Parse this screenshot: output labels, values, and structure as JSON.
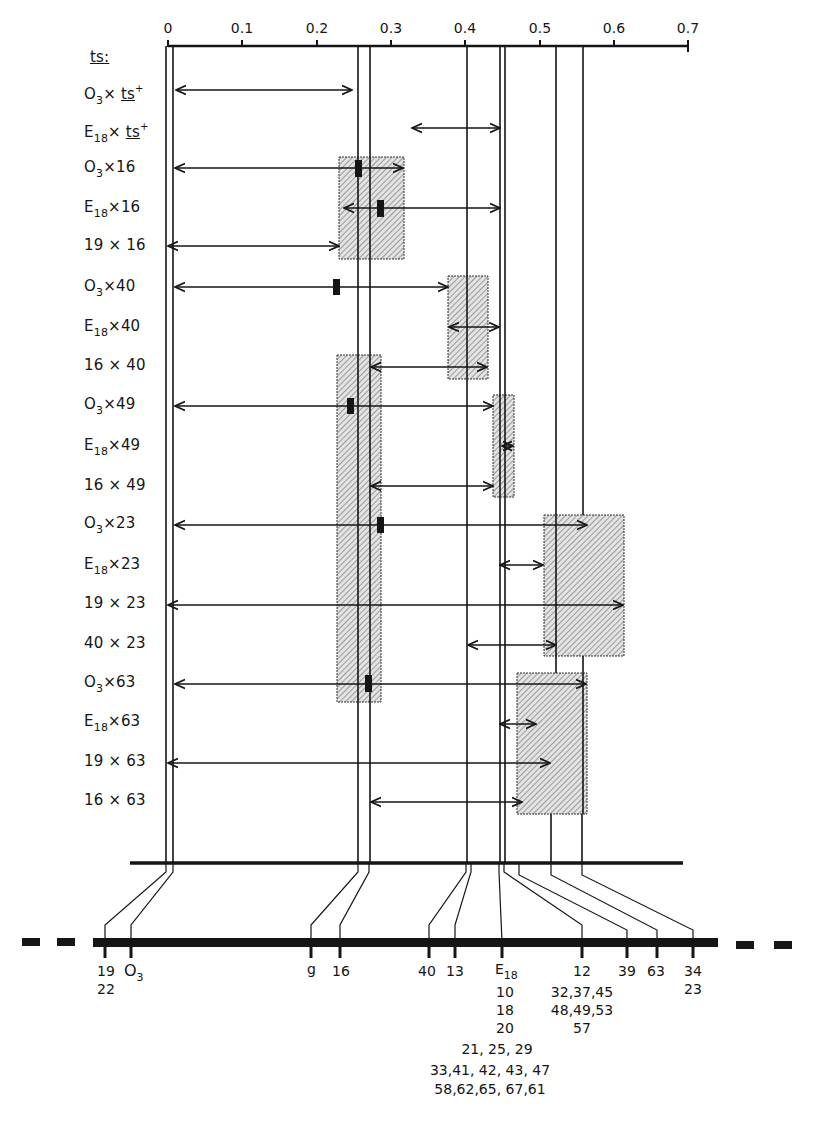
{
  "axis": {
    "ticks": [
      "0",
      "0.1",
      "0.2",
      "0.3",
      "0.4",
      "0.5",
      "0.6",
      "0.7"
    ],
    "x0": 168,
    "unit_px": 74.3
  },
  "header_label": "ts:",
  "rows": [
    {
      "a": "O",
      "a_sub": "3",
      "x": "×",
      "b": "ts",
      "b_sup": "+",
      "b_underline": true
    },
    {
      "a": "E",
      "a_sub": "18",
      "x": "×",
      "b": "ts",
      "b_sup": "+",
      "b_underline": true
    },
    {
      "a": "O",
      "a_sub": "3",
      "x": "×",
      "b": "16"
    },
    {
      "a": "E",
      "a_sub": "18",
      "x": "×",
      "b": "16"
    },
    {
      "a": "19",
      "a_sub": "",
      "x": " × ",
      "b": "16"
    },
    {
      "a": "O",
      "a_sub": "3",
      "x": "×",
      "b": "40"
    },
    {
      "a": "E",
      "a_sub": "18",
      "x": "×",
      "b": "40"
    },
    {
      "a": "16",
      "a_sub": "",
      "x": " × ",
      "b": "40"
    },
    {
      "a": "O",
      "a_sub": "3",
      "x": "×",
      "b": "49"
    },
    {
      "a": "E",
      "a_sub": "18",
      "x": "×",
      "b": "49"
    },
    {
      "a": "16",
      "a_sub": "",
      "x": " × ",
      "b": "49"
    },
    {
      "a": "O",
      "a_sub": "3",
      "x": "×",
      "b": "23"
    },
    {
      "a": "E",
      "a_sub": "18",
      "x": "×",
      "b": "23"
    },
    {
      "a": "19",
      "a_sub": "",
      "x": " × ",
      "b": "23"
    },
    {
      "a": "40",
      "a_sub": "",
      "x": " × ",
      "b": "23"
    },
    {
      "a": "O",
      "a_sub": "3",
      "x": "×",
      "b": "63"
    },
    {
      "a": "E",
      "a_sub": "18",
      "x": "×",
      "b": "63"
    },
    {
      "a": "19",
      "a_sub": "",
      "x": " × ",
      "b": "63"
    },
    {
      "a": "16",
      "a_sub": "",
      "x": " × ",
      "b": "63"
    }
  ],
  "map_labels": {
    "l19": "19",
    "l22": "22",
    "lO": "O",
    "lO_sub": "3",
    "lg": "g",
    "l16": "16",
    "l40": "40",
    "l13": "13",
    "lE": "E",
    "lE_sub": "18",
    "e_stack": [
      "10",
      "18",
      "20",
      "21, 25, 29",
      "33,41, 42, 43, 47",
      "58,62,65, 67,61"
    ],
    "l12_stack": [
      "12",
      "32,37,45",
      "48,49,53",
      "57"
    ],
    "l39": "39",
    "l63": "63",
    "l34": "34",
    "l23": "23"
  },
  "colors": {
    "ink": "#151515",
    "hatch_fill": "#d9d9d9",
    "paper": "#ffffff"
  }
}
